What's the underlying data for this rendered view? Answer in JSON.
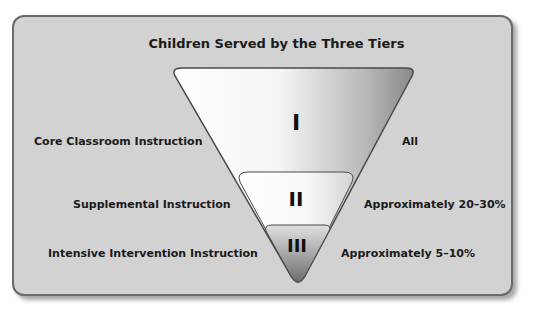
{
  "diagram": {
    "title": "Children Served by the Three Tiers",
    "tiers": [
      {
        "numeral": "I",
        "instruction": "Core Classroom Instruction",
        "population": "All"
      },
      {
        "numeral": "II",
        "instruction": "Supplemental Instruction",
        "population": "Approximately 20–30%"
      },
      {
        "numeral": "III",
        "instruction": "Intensive Intervention Instruction",
        "population": "Approximately 5–10%"
      }
    ],
    "colors": {
      "panel_background": "#d2d2d2",
      "panel_border": "#6a6a6a",
      "tier1_light": "#ffffff",
      "tier1_dark": "#8a8a8a",
      "tier3_dark": "#6e6e6e"
    }
  }
}
